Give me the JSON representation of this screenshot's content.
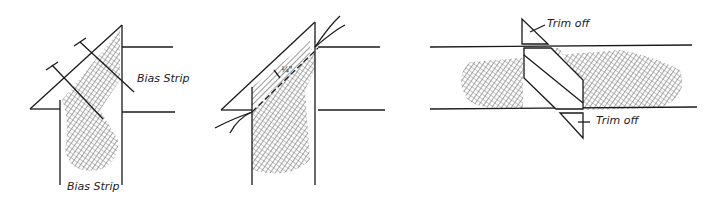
{
  "figure": {
    "panels": [
      {
        "id": "pin-strips",
        "labels": {
          "side": "Bias Strip",
          "bottom": "Bias Strip"
        }
      },
      {
        "id": "stitch-seam",
        "labels": {
          "seam_allowance": "¼\""
        }
      },
      {
        "id": "trim-ends",
        "labels": {
          "top": "Trim off",
          "bottom": "Trim off"
        }
      }
    ],
    "colors": {
      "ink": "#1a1a1a",
      "hatch": "#555555",
      "paper": "#ffffff"
    }
  }
}
